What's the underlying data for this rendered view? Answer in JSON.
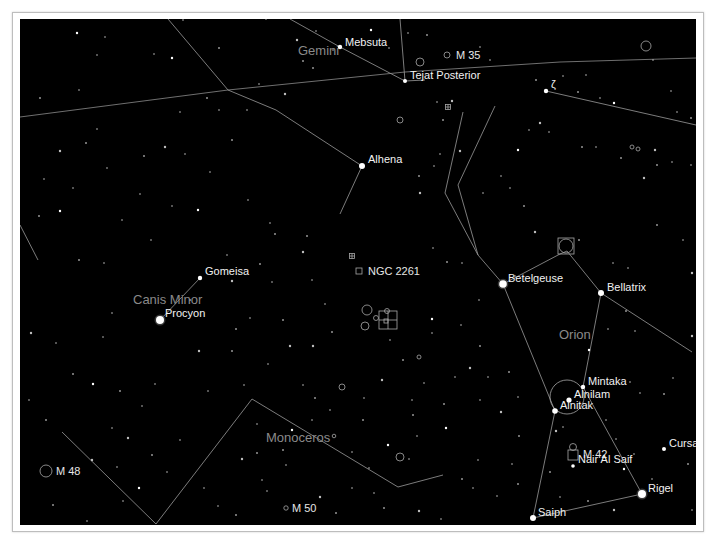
{
  "chart": {
    "background": "#000000",
    "frame_color": "#bdbdbd",
    "constellations": [
      {
        "name": "Gemini",
        "x": 298,
        "y": 55
      },
      {
        "name": "Canis Minor",
        "x": 133,
        "y": 304
      },
      {
        "name": "Orion",
        "x": 559,
        "y": 339
      },
      {
        "name": "Monoceros",
        "x": 266,
        "y": 442
      }
    ],
    "bright_stars": [
      {
        "name": "Mebsuta",
        "x": 340,
        "y": 47,
        "r": 2.2,
        "lx": 345,
        "ly": 46
      },
      {
        "name": "Tejat Posterior",
        "x": 405,
        "y": 81,
        "r": 2.0,
        "lx": 410,
        "ly": 79
      },
      {
        "name": "Alhena",
        "x": 362,
        "y": 166,
        "r": 3.0,
        "lx": 368,
        "ly": 163
      },
      {
        "name": "Gomeisa",
        "x": 200,
        "y": 278,
        "r": 2.2,
        "lx": 205,
        "ly": 275
      },
      {
        "name": "Procyon",
        "x": 160,
        "y": 320,
        "r": 4.0,
        "lx": 165,
        "ly": 317
      },
      {
        "name": "Betelgeuse",
        "x": 503,
        "y": 284,
        "r": 3.8,
        "lx": 508,
        "ly": 282
      },
      {
        "name": "Bellatrix",
        "x": 601,
        "y": 293,
        "r": 3.0,
        "lx": 607,
        "ly": 291
      },
      {
        "name": "Mintaka",
        "x": 583,
        "y": 387,
        "r": 2.2,
        "lx": 588,
        "ly": 385
      },
      {
        "name": "Alnilam",
        "x": 569,
        "y": 400,
        "r": 2.6,
        "lx": 574,
        "ly": 398
      },
      {
        "name": "Alnitak",
        "x": 555,
        "y": 411,
        "r": 2.8,
        "lx": 560,
        "ly": 409
      },
      {
        "name": "Nair Al Saif",
        "x": 573,
        "y": 466,
        "r": 1.8,
        "lx": 578,
        "ly": 463
      },
      {
        "name": "Cursa",
        "x": 664,
        "y": 449,
        "r": 2.0,
        "lx": 669,
        "ly": 447
      },
      {
        "name": "Rigel",
        "x": 642,
        "y": 494,
        "r": 4.0,
        "lx": 648,
        "ly": 492
      },
      {
        "name": "Saiph",
        "x": 533,
        "y": 518,
        "r": 3.0,
        "lx": 538,
        "ly": 516
      },
      {
        "name": "ζ",
        "x": 546,
        "y": 91,
        "r": 2.2,
        "lx": 551,
        "ly": 88
      }
    ],
    "deep_sky": [
      {
        "name": "M 35",
        "x": 447,
        "y": 55,
        "shape": "circle",
        "size": 3,
        "lx": 456,
        "ly": 59
      },
      {
        "name": "NGC 2261",
        "x": 359,
        "y": 271,
        "shape": "square",
        "size": 3,
        "lx": 368,
        "ly": 275
      },
      {
        "name": "M 48",
        "x": 46,
        "y": 471,
        "shape": "circle",
        "size": 6,
        "lx": 56,
        "ly": 475
      },
      {
        "name": "M 50",
        "x": 286,
        "y": 508,
        "shape": "circle",
        "size": 2.2,
        "lx": 292,
        "ly": 512
      },
      {
        "name": "M 42",
        "x": 573,
        "y": 455,
        "shape": "square",
        "size": 5,
        "lx": 583,
        "ly": 458
      }
    ],
    "unlabeled_dso": [
      {
        "x": 646,
        "y": 46,
        "shape": "circle",
        "size": 5
      },
      {
        "x": 420,
        "y": 62,
        "shape": "circle",
        "size": 4
      },
      {
        "x": 400,
        "y": 120,
        "shape": "circle",
        "size": 3
      },
      {
        "x": 448,
        "y": 107,
        "shape": "cluster",
        "size": 2.5
      },
      {
        "x": 632,
        "y": 147,
        "shape": "circle",
        "size": 2
      },
      {
        "x": 638,
        "y": 149,
        "shape": "circle",
        "size": 2
      },
      {
        "x": 352,
        "y": 256,
        "shape": "cluster",
        "size": 2.5
      },
      {
        "x": 367,
        "y": 310,
        "shape": "circle",
        "size": 5
      },
      {
        "x": 376,
        "y": 318,
        "shape": "circle",
        "size": 2.5
      },
      {
        "x": 365,
        "y": 326,
        "shape": "circle",
        "size": 4
      },
      {
        "x": 387,
        "y": 311,
        "shape": "circle",
        "size": 2.5
      },
      {
        "x": 388,
        "y": 320,
        "shape": "grid",
        "size": 9
      },
      {
        "x": 419,
        "y": 357,
        "shape": "circle",
        "size": 2
      },
      {
        "x": 342,
        "y": 387,
        "shape": "circle",
        "size": 3
      },
      {
        "x": 334,
        "y": 436,
        "shape": "circle",
        "size": 1.8
      },
      {
        "x": 400,
        "y": 457,
        "shape": "circle",
        "size": 4
      },
      {
        "x": 566,
        "y": 246,
        "shape": "square",
        "size": 8
      },
      {
        "x": 566,
        "y": 246,
        "shape": "circle",
        "size": 7
      },
      {
        "x": 567,
        "y": 397,
        "shape": "circle",
        "size": 17
      },
      {
        "x": 573,
        "y": 447,
        "shape": "circle",
        "size": 3.5
      }
    ],
    "constellation_lines": [
      [
        [
          168,
          19
        ],
        [
          228,
          90
        ],
        [
          276,
          110
        ],
        [
          362,
          166
        ],
        [
          340,
          214
        ]
      ],
      [
        [
          400,
          19
        ],
        [
          405,
          81
        ],
        [
          425,
          80
        ]
      ],
      [
        [
          290,
          19
        ],
        [
          340,
          47
        ],
        [
          405,
          81
        ]
      ],
      [
        [
          200,
          278
        ],
        [
          160,
          320
        ]
      ],
      [
        [
          20,
          225
        ],
        [
          38,
          260
        ]
      ],
      [
        [
          463,
          112
        ],
        [
          445,
          193
        ],
        [
          478,
          255
        ],
        [
          503,
          284
        ],
        [
          555,
          411
        ],
        [
          533,
          518
        ]
      ],
      [
        [
          495,
          106
        ],
        [
          458,
          185
        ],
        [
          478,
          255
        ]
      ],
      [
        [
          503,
          284
        ],
        [
          560,
          254
        ],
        [
          567,
          251
        ],
        [
          601,
          293
        ],
        [
          583,
          387
        ]
      ],
      [
        [
          601,
          293
        ],
        [
          692,
          352
        ]
      ],
      [
        [
          583,
          387
        ],
        [
          642,
          494
        ],
        [
          533,
          518
        ]
      ],
      [
        [
          62,
          432
        ],
        [
          156,
          524
        ],
        [
          252,
          399
        ],
        [
          398,
          487
        ],
        [
          443,
          475
        ]
      ],
      [
        [
          546,
          91
        ],
        [
          696,
          125
        ]
      ]
    ],
    "ecliptic": [
      [
        20,
        117
      ],
      [
        228,
        90
      ],
      [
        405,
        72
      ],
      [
        560,
        62
      ],
      [
        696,
        58
      ]
    ],
    "faint_stars": [
      [
        77,
        33
      ],
      [
        105,
        37
      ],
      [
        183,
        20
      ],
      [
        219,
        48
      ],
      [
        266,
        19
      ],
      [
        297,
        40
      ],
      [
        303,
        61
      ],
      [
        316,
        31
      ],
      [
        333,
        50
      ],
      [
        313,
        68
      ],
      [
        285,
        94
      ],
      [
        259,
        84
      ],
      [
        207,
        98
      ],
      [
        180,
        112
      ],
      [
        154,
        54
      ],
      [
        172,
        58
      ],
      [
        219,
        110
      ],
      [
        247,
        110
      ],
      [
        232,
        140
      ],
      [
        185,
        154
      ],
      [
        165,
        147
      ],
      [
        144,
        156
      ],
      [
        107,
        168
      ],
      [
        97,
        129
      ],
      [
        86,
        143
      ],
      [
        60,
        151
      ],
      [
        44,
        179
      ],
      [
        40,
        98
      ],
      [
        79,
        90
      ],
      [
        97,
        55
      ],
      [
        371,
        30
      ],
      [
        389,
        48
      ],
      [
        408,
        33
      ],
      [
        427,
        35
      ],
      [
        437,
        102
      ],
      [
        452,
        101
      ],
      [
        470,
        52
      ],
      [
        480,
        47
      ],
      [
        490,
        60
      ],
      [
        536,
        80
      ],
      [
        540,
        123
      ],
      [
        563,
        76
      ],
      [
        578,
        92
      ],
      [
        586,
        75
      ],
      [
        600,
        98
      ],
      [
        614,
        103
      ],
      [
        653,
        60
      ],
      [
        671,
        91
      ],
      [
        691,
        118
      ],
      [
        677,
        112
      ],
      [
        655,
        150
      ],
      [
        657,
        165
      ],
      [
        672,
        162
      ],
      [
        691,
        165
      ],
      [
        621,
        158
      ],
      [
        644,
        178
      ],
      [
        596,
        147
      ],
      [
        582,
        147
      ],
      [
        549,
        132
      ],
      [
        529,
        130
      ],
      [
        518,
        150
      ],
      [
        501,
        176
      ],
      [
        510,
        188
      ],
      [
        524,
        206
      ],
      [
        483,
        193
      ],
      [
        460,
        151
      ],
      [
        443,
        120
      ],
      [
        440,
        154
      ],
      [
        434,
        166
      ],
      [
        419,
        176
      ],
      [
        420,
        193
      ],
      [
        433,
        248
      ],
      [
        447,
        262
      ],
      [
        462,
        263
      ],
      [
        479,
        300
      ],
      [
        432,
        319
      ],
      [
        432,
        333
      ],
      [
        461,
        325
      ],
      [
        480,
        346
      ],
      [
        515,
        276
      ],
      [
        535,
        232
      ],
      [
        579,
        240
      ],
      [
        613,
        263
      ],
      [
        628,
        268
      ],
      [
        657,
        225
      ],
      [
        692,
        273
      ],
      [
        683,
        240
      ],
      [
        626,
        311
      ],
      [
        635,
        331
      ],
      [
        608,
        329
      ],
      [
        589,
        350
      ],
      [
        630,
        382
      ],
      [
        640,
        393
      ],
      [
        664,
        394
      ],
      [
        673,
        378
      ],
      [
        692,
        336
      ],
      [
        79,
        260
      ],
      [
        104,
        263
      ],
      [
        151,
        240
      ],
      [
        190,
        300
      ],
      [
        232,
        281
      ],
      [
        270,
        223
      ],
      [
        275,
        234
      ],
      [
        227,
        255
      ],
      [
        248,
        200
      ],
      [
        198,
        210
      ],
      [
        172,
        206
      ],
      [
        210,
        172
      ],
      [
        260,
        264
      ],
      [
        272,
        282
      ],
      [
        303,
        252
      ],
      [
        307,
        236
      ],
      [
        312,
        280
      ],
      [
        325,
        304
      ],
      [
        332,
        332
      ],
      [
        313,
        346
      ],
      [
        303,
        385
      ],
      [
        315,
        398
      ],
      [
        330,
        410
      ],
      [
        312,
        420
      ],
      [
        292,
        430
      ],
      [
        257,
        424
      ],
      [
        286,
        465
      ],
      [
        283,
        450
      ],
      [
        262,
        480
      ],
      [
        242,
        459
      ],
      [
        257,
        453
      ],
      [
        180,
        440
      ],
      [
        167,
        472
      ],
      [
        152,
        455
      ],
      [
        92,
        460
      ],
      [
        117,
        467
      ],
      [
        53,
        505
      ],
      [
        87,
        521
      ],
      [
        123,
        501
      ],
      [
        139,
        488
      ],
      [
        204,
        488
      ],
      [
        218,
        506
      ],
      [
        236,
        515
      ],
      [
        267,
        491
      ],
      [
        320,
        497
      ],
      [
        336,
        513
      ],
      [
        352,
        488
      ],
      [
        374,
        493
      ],
      [
        384,
        508
      ],
      [
        419,
        511
      ],
      [
        441,
        519
      ],
      [
        462,
        479
      ],
      [
        473,
        488
      ],
      [
        478,
        460
      ],
      [
        446,
        428
      ],
      [
        417,
        436
      ],
      [
        409,
        459
      ],
      [
        444,
        404
      ],
      [
        480,
        400
      ],
      [
        501,
        412
      ],
      [
        519,
        436
      ],
      [
        512,
        464
      ],
      [
        497,
        496
      ],
      [
        518,
        484
      ],
      [
        556,
        431
      ],
      [
        563,
        427
      ],
      [
        550,
        472
      ],
      [
        606,
        420
      ],
      [
        616,
        439
      ],
      [
        624,
        469
      ],
      [
        634,
        454
      ],
      [
        652,
        479
      ],
      [
        688,
        464
      ],
      [
        692,
        510
      ],
      [
        614,
        510
      ],
      [
        588,
        501
      ],
      [
        560,
        497
      ],
      [
        390,
        340
      ],
      [
        403,
        360
      ],
      [
        382,
        380
      ],
      [
        364,
        398
      ],
      [
        363,
        420
      ],
      [
        352,
        452
      ],
      [
        369,
        468
      ],
      [
        388,
        445
      ],
      [
        412,
        400
      ],
      [
        424,
        383
      ],
      [
        413,
        415
      ],
      [
        455,
        377
      ],
      [
        470,
        368
      ],
      [
        509,
        372
      ],
      [
        518,
        397
      ],
      [
        488,
        377
      ],
      [
        39,
        216
      ],
      [
        31,
        333
      ],
      [
        56,
        343
      ],
      [
        73,
        374
      ],
      [
        103,
        337
      ],
      [
        112,
        313
      ],
      [
        93,
        384
      ],
      [
        142,
        406
      ],
      [
        155,
        384
      ],
      [
        120,
        391
      ],
      [
        208,
        391
      ],
      [
        199,
        351
      ],
      [
        232,
        351
      ],
      [
        244,
        385
      ],
      [
        268,
        364
      ],
      [
        283,
        320
      ],
      [
        290,
        346
      ],
      [
        250,
        318
      ],
      [
        236,
        329
      ],
      [
        122,
        220
      ],
      [
        140,
        194
      ],
      [
        60,
        211
      ],
      [
        73,
        188
      ],
      [
        29,
        400
      ],
      [
        46,
        420
      ],
      [
        112,
        428
      ],
      [
        128,
        438
      ]
    ]
  }
}
